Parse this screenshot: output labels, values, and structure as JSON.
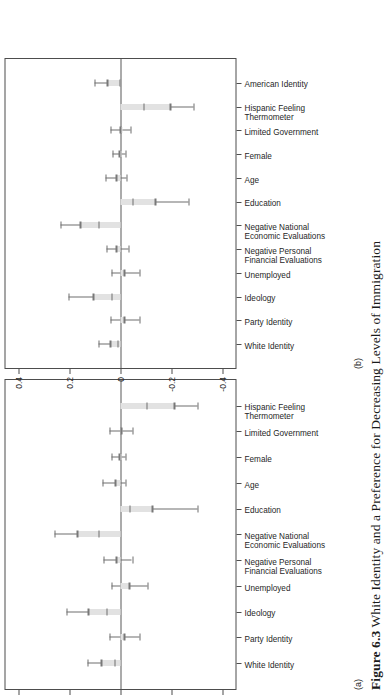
{
  "figure": {
    "caption_label": "Figure 6.3",
    "caption_text": "White Identity and a Preference for Decreasing Levels of Immigration",
    "panel_a_letter": "(a)",
    "panel_b_letter": "(b)"
  },
  "chart_data": [
    {
      "type": "scatter",
      "panel": "(a)",
      "title": "",
      "subtitle": "",
      "xlabel": "",
      "ylabel": "",
      "ylim": [
        -0.45,
        0.45
      ],
      "grid": false,
      "legend": "none",
      "zero_reference_line": 0,
      "yticks": [
        0.4,
        0.2,
        0,
        -0.2,
        -0.4
      ],
      "ytick_labels": [
        "0.4",
        "0.2",
        "0",
        "-0.2",
        "-0.4"
      ],
      "categories": [
        "White Identity",
        "Party Identity",
        "Ideology",
        "Unemployed",
        "Negative Personal\nFinancial Evaluations",
        "Negative National\nEconomic Evaluations",
        "Education",
        "Age",
        "Female",
        "Limited Government",
        "Hispanic Feeling\nThermometer"
      ],
      "estimates": [
        0.075,
        -0.015,
        0.125,
        -0.035,
        0.015,
        0.17,
        -0.125,
        0.02,
        0.005,
        -0.005,
        -0.21
      ],
      "ci_low": [
        0.025,
        -0.075,
        0.055,
        -0.105,
        -0.045,
        0.085,
        -0.3,
        -0.02,
        -0.02,
        -0.045,
        -0.3
      ],
      "ci_high": [
        0.13,
        0.045,
        0.21,
        0.035,
        0.065,
        0.26,
        -0.035,
        0.07,
        0.035,
        0.045,
        -0.1
      ]
    },
    {
      "type": "scatter",
      "panel": "(b)",
      "title": "",
      "subtitle": "",
      "xlabel": "",
      "ylabel": "",
      "ylim": [
        -0.45,
        0.45
      ],
      "grid": false,
      "legend": "none",
      "zero_reference_line": 0,
      "yticks": [
        0.4,
        0.2,
        0,
        -0.2,
        -0.4
      ],
      "ytick_labels": [
        "0.4",
        "0.2",
        "0",
        "-0.2",
        "-0.4"
      ],
      "categories": [
        "White Identity",
        "Party Identity",
        "Ideology",
        "Unemployed",
        "Negative Personal\nFinancial Evaluations",
        "Negative National\nEconomic Evaluations",
        "Education",
        "Age",
        "Female",
        "Limited Government",
        "Hispanic Feeling\nThermometer",
        "American Identity"
      ],
      "estimates": [
        0.04,
        -0.015,
        0.105,
        -0.015,
        0.015,
        0.155,
        -0.135,
        0.015,
        0.005,
        0.0,
        -0.195,
        0.05
      ],
      "ci_low": [
        0.01,
        -0.075,
        0.035,
        -0.075,
        -0.03,
        0.085,
        -0.265,
        -0.025,
        -0.02,
        -0.04,
        -0.285,
        0.005
      ],
      "ci_high": [
        0.085,
        0.04,
        0.205,
        0.035,
        0.055,
        0.235,
        -0.045,
        0.06,
        0.03,
        0.04,
        -0.09,
        0.1
      ]
    }
  ]
}
